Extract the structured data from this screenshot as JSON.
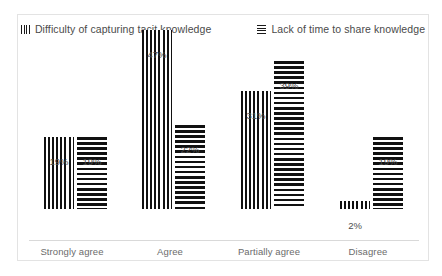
{
  "chart_data": {
    "type": "bar",
    "title": "",
    "xlabel": "",
    "ylabel": "",
    "ylim": [
      0,
      50
    ],
    "grid": false,
    "legend_position": "top",
    "categories": [
      "Strongly agree",
      "Agree",
      "Partially agree",
      "Disagree"
    ],
    "series": [
      {
        "name": "Difficulty of capturing tacit knowledge",
        "pattern": "vertical-lines",
        "color": "#111111",
        "values": [
          19,
          47,
          31,
          2
        ],
        "data_labels": [
          "19%",
          "47%",
          "31%",
          "2%"
        ]
      },
      {
        "name": "Lack of time to share knowledge",
        "pattern": "horizontal-lines",
        "color": "#111111",
        "values": [
          19,
          22,
          39,
          19
        ],
        "data_labels": [
          "19%",
          "22%",
          "39%",
          "19%"
        ]
      }
    ]
  },
  "legend": {
    "entries": [
      {
        "label": "Difficulty of capturing tacit knowledge",
        "swatch": "vertical-lines-swatch"
      },
      {
        "label": "Lack of time to share knowledge",
        "swatch": "horizontal-lines-swatch"
      }
    ]
  },
  "colors": {
    "frame_border": "#e3e3e3",
    "baseline": "#d9d9d9",
    "bar_ink": "#111111",
    "label_text": "#4d4d4d",
    "category_text": "#6b6b6b",
    "legend_text": "#4a4a4a",
    "background": "#ffffff"
  }
}
